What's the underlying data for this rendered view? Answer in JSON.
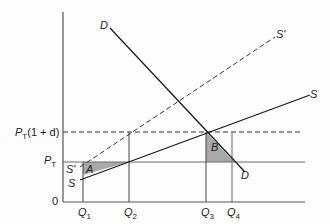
{
  "diagram": {
    "type": "supply-demand-tariff-diagram",
    "axes": {
      "origin_label": "0"
    },
    "price_levels": [
      {
        "id": "pt_1d",
        "label_main": "P",
        "label_sub": "T",
        "label_suffix": "(1 + d)"
      },
      {
        "id": "pt",
        "label_main": "P",
        "label_sub": "T",
        "label_suffix": ""
      }
    ],
    "quantities": [
      {
        "id": "q1",
        "label_main": "Q",
        "label_sub": "1"
      },
      {
        "id": "q2",
        "label_main": "Q",
        "label_sub": "2"
      },
      {
        "id": "q3",
        "label_main": "Q",
        "label_sub": "3"
      },
      {
        "id": "q4",
        "label_main": "Q",
        "label_sub": "4"
      }
    ],
    "curves": {
      "demand_top": "D",
      "demand_bottom": "D",
      "supply_right": "S",
      "supply_left": "S",
      "supply_shifted_right": "S'",
      "supply_shifted_left": "S'"
    },
    "areas": {
      "a": "A",
      "b": "B"
    },
    "colors": {
      "line": "#1a1a1a",
      "guide": "#555555",
      "shade": "#a8a8a8"
    }
  }
}
